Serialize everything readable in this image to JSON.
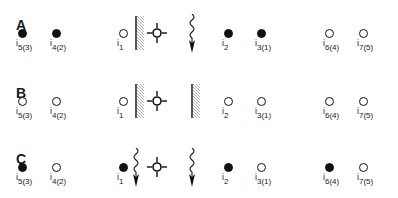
{
  "diagram": {
    "rows": [
      {
        "label": "A",
        "nodes": [
          {
            "id": "i5",
            "sub": "5(3)",
            "state": "filled"
          },
          {
            "id": "i4",
            "sub": "4(2)",
            "state": "filled"
          },
          {
            "id": "i1",
            "sub": "1",
            "state": "open"
          },
          {
            "id": "i2",
            "sub": "2",
            "state": "filled"
          },
          {
            "id": "i3",
            "sub": "3(1)",
            "state": "filled"
          },
          {
            "id": "i6",
            "sub": "6(4)",
            "state": "open"
          },
          {
            "id": "i7",
            "sub": "7(5)",
            "state": "open"
          }
        ],
        "symbols": [
          "barrier",
          "source",
          "wavy-arrow"
        ]
      },
      {
        "label": "B",
        "nodes": [
          {
            "id": "i5",
            "sub": "5(3)",
            "state": "open"
          },
          {
            "id": "i4",
            "sub": "4(2)",
            "state": "open"
          },
          {
            "id": "i1",
            "sub": "1",
            "state": "open"
          },
          {
            "id": "i2",
            "sub": "2",
            "state": "open"
          },
          {
            "id": "i3",
            "sub": "3(1)",
            "state": "open"
          },
          {
            "id": "i6",
            "sub": "6(4)",
            "state": "open"
          },
          {
            "id": "i7",
            "sub": "7(5)",
            "state": "open"
          }
        ],
        "symbols": [
          "barrier",
          "source",
          "barrier"
        ]
      },
      {
        "label": "C",
        "nodes": [
          {
            "id": "i5",
            "sub": "5(3)",
            "state": "filled"
          },
          {
            "id": "i4",
            "sub": "4(2)",
            "state": "open"
          },
          {
            "id": "i1",
            "sub": "1",
            "state": "filled"
          },
          {
            "id": "i2",
            "sub": "2",
            "state": "filled"
          },
          {
            "id": "i3",
            "sub": "3(1)",
            "state": "open"
          },
          {
            "id": "i6",
            "sub": "6(4)",
            "state": "filled"
          },
          {
            "id": "i7",
            "sub": "7(5)",
            "state": "open"
          }
        ],
        "symbols": [
          "wavy-arrow",
          "source",
          "wavy-arrow"
        ]
      }
    ],
    "letter_i": "i",
    "colors": {
      "ink": "#111111",
      "background": "#ffffff",
      "hatch": "#888888"
    }
  }
}
